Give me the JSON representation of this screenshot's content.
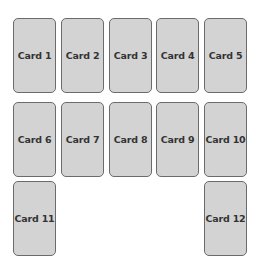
{
  "header": {
    "title": ""
  },
  "colors": {
    "card_fill": "#d3d3d3",
    "card_border": "#6b6b6b",
    "card_text": "#333333"
  },
  "cards": [
    {
      "label": "Card 1",
      "x": 13,
      "y": 18
    },
    {
      "label": "Card 2",
      "x": 61,
      "y": 18
    },
    {
      "label": "Card 3",
      "x": 109,
      "y": 18
    },
    {
      "label": "Card 4",
      "x": 156,
      "y": 18
    },
    {
      "label": "Card 5",
      "x": 204,
      "y": 18
    },
    {
      "label": "Card 6",
      "x": 13,
      "y": 102
    },
    {
      "label": "Card 7",
      "x": 61,
      "y": 102
    },
    {
      "label": "Card 8",
      "x": 109,
      "y": 102
    },
    {
      "label": "Card 9",
      "x": 156,
      "y": 102
    },
    {
      "label": "Card 10",
      "x": 204,
      "y": 102
    },
    {
      "label": "Card 11",
      "x": 13,
      "y": 181
    },
    {
      "label": "Card 12",
      "x": 204,
      "y": 181
    }
  ]
}
